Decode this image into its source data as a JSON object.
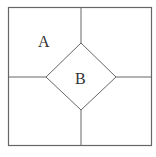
{
  "diagram": {
    "stroke_color": "#666666",
    "labels": {
      "region_a": "A",
      "region_b": "B"
    }
  }
}
